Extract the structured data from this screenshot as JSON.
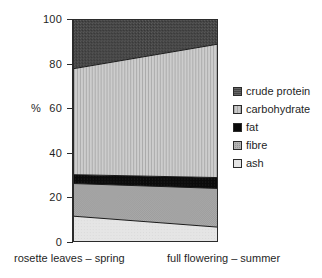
{
  "chart_data": {
    "type": "area",
    "title": "",
    "subtitle": "",
    "xlabel": "",
    "ylabel": "%",
    "ylim": [
      0,
      100
    ],
    "yticks": [
      0,
      20,
      40,
      60,
      80,
      100
    ],
    "ytick_labels": [
      "0",
      "20",
      "40",
      "60",
      "80",
      "100"
    ],
    "grid": false,
    "stacked": true,
    "stack_order_bottom_to_top": [
      "ash",
      "fibre",
      "fat",
      "carbohydrate",
      "crude protein"
    ],
    "legend_position": "right",
    "categories": [
      "rosette leaves – spring",
      "full flowering – summer"
    ],
    "series": [
      {
        "name": "crude protein",
        "values": [
          22.0,
          11.0
        ],
        "color": "#454545",
        "pattern": "dark-speckle"
      },
      {
        "name": "carbohydrate",
        "values": [
          48.0,
          60.3
        ],
        "color": "#c9c9c9",
        "pattern": "vertical-lines"
      },
      {
        "name": "fat",
        "values": [
          4.0,
          4.9
        ],
        "color": "#0a0a0a",
        "pattern": "solid"
      },
      {
        "name": "fibre",
        "values": [
          14.8,
          17.5
        ],
        "color": "#9a9a9a",
        "pattern": "fine-checker"
      },
      {
        "name": "ash",
        "values": [
          11.2,
          6.3
        ],
        "color": "#e4e4e4",
        "pattern": "solid-light"
      }
    ],
    "cumulative_boundaries": {
      "rosette leaves – spring": {
        "ash_top": 11.2,
        "fibre_top": 26.0,
        "fat_top": 30.0,
        "carbohydrate_top": 78.0,
        "crude_protein_top": 100
      },
      "full flowering – summer": {
        "ash_top": 6.3,
        "fibre_top": 23.8,
        "fat_top": 28.7,
        "carbohydrate_top": 89.0,
        "crude_protein_top": 100
      }
    }
  },
  "axis": {
    "y_title": "%",
    "y_tick_labels": [
      "100",
      "80",
      "60",
      "40",
      "20",
      "0"
    ]
  },
  "x_categories": [
    {
      "label": "rosette leaves – spring"
    },
    {
      "label": "full flowering – summer"
    }
  ],
  "legend": {
    "items": [
      {
        "label": "crude protein",
        "swatch": "sw-crude-protein",
        "color": "#454545"
      },
      {
        "label": "carbohydrate",
        "swatch": "sw-carbohydrate",
        "color": "#c9c9c9"
      },
      {
        "label": "fat",
        "swatch": "sw-fat",
        "color": "#0a0a0a"
      },
      {
        "label": "fibre",
        "swatch": "sw-fibre",
        "color": "#9a9a9a"
      },
      {
        "label": "ash",
        "swatch": "sw-ash",
        "color": "#e4e4e4"
      }
    ]
  }
}
